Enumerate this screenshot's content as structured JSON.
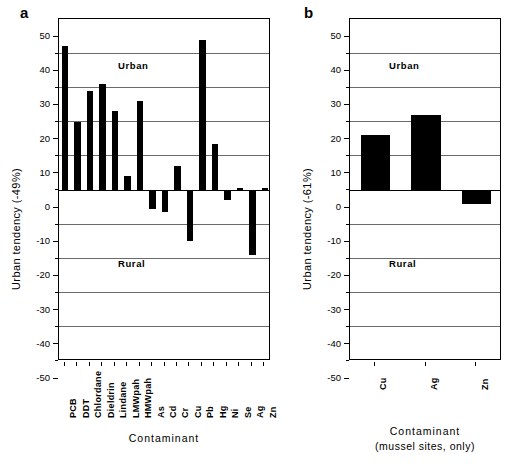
{
  "figure": {
    "background": "#ffffff",
    "bar_color": "#000000",
    "grid_color": "#6a6a6a",
    "axis_color": "#000000"
  },
  "panel_a": {
    "letter": "a",
    "ytitle": "Urban tendency  (-49%)",
    "xtitle": "Contaminant",
    "urban_label": "Urban",
    "rural_label": "Rural",
    "yticks": [
      "50",
      "40",
      "30",
      "20",
      "10",
      "0",
      "-10",
      "-20",
      "-30",
      "-40",
      "-50"
    ]
  },
  "panel_b": {
    "letter": "b",
    "ytitle": "Urban tendency  (-61%)",
    "xtitle": "Contaminant",
    "xtitle_sub": "(mussel sites, only)",
    "urban_label": "Urban",
    "rural_label": "Rural",
    "yticks": [
      "50",
      "40",
      "30",
      "20",
      "10",
      "0",
      "-10",
      "-20",
      "-30",
      "-40",
      "-50"
    ]
  },
  "chart_data": [
    {
      "type": "bar",
      "panel": "a",
      "title": "",
      "xlabel": "Contaminant",
      "ylabel": "Urban tendency  (-49%)",
      "ylim": [
        -50,
        50
      ],
      "ytick_step": 10,
      "grid": true,
      "legend": "none",
      "annotations": [
        "Urban",
        "Rural"
      ],
      "categories": [
        "PCB",
        "DDT",
        "Chlordane",
        "Dieldrin",
        "Lindane",
        "LMWpah",
        "HMWpah",
        "As",
        "Cd",
        "Cr",
        "Cu",
        "Pb",
        "Hg",
        "Ni",
        "Se",
        "Ag",
        "Zn"
      ],
      "values": [
        42,
        20,
        29,
        31,
        23,
        4,
        26,
        -5.5,
        -6.5,
        7,
        -15,
        44,
        13.5,
        -3,
        0.5,
        -19,
        0.5
      ]
    },
    {
      "type": "bar",
      "panel": "b",
      "title": "",
      "xlabel": "Contaminant (mussel sites, only)",
      "ylabel": "Urban tendency  (-61%)",
      "ylim": [
        -50,
        50
      ],
      "ytick_step": 10,
      "grid": true,
      "legend": "none",
      "annotations": [
        "Urban",
        "Rural"
      ],
      "categories": [
        "Cu",
        "Ag",
        "Zn"
      ],
      "values": [
        16,
        22,
        -4
      ]
    }
  ]
}
